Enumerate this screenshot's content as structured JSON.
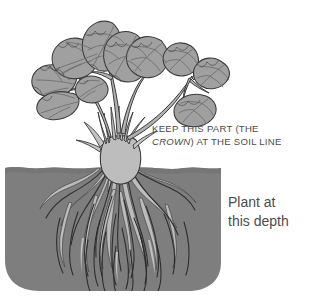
{
  "illustration": {
    "title": "Planting depth diagram for a crown-forming perennial",
    "subject": "strawberry-plant-planting-depth",
    "width": 311,
    "height": 307,
    "background_color": "#ffffff"
  },
  "annotations": {
    "crown": {
      "name": "crown-annotation",
      "line1": "KEEP THIS PART (THE",
      "line2_italic": "CROWN",
      "line2_rest": ") AT THE SOIL LINE",
      "text_color": "#4c4c4c"
    },
    "depth": {
      "name": "depth-annotation",
      "line1": "Plant at",
      "line2": "this depth",
      "text_color": "#4c4c4c"
    }
  },
  "colors": {
    "soil_fill": "#7e7e7e",
    "soil_edge": "#6f6f6f",
    "leaf_fill": "#a0a0a0",
    "leaf_outline": "#3a3a3a",
    "leaf_vein": "#6a6a6a",
    "stem_fill": "#b0b0b0",
    "stem_outline": "#3a3a3a",
    "crown_fill": "#bdbdbd",
    "crown_outline": "#3a3a3a",
    "root_fill": "#bcbcbc",
    "root_outline": "#555555",
    "fibrous_root": "#2e2e2e",
    "page_background": "#ffffff"
  },
  "parts": {
    "foliage": "leaf-canopy",
    "stems": "leaf-stems",
    "crown": "crown-at-soil-line",
    "soil": "soil-block",
    "soil_line": "soil-surface-line",
    "roots": "root-system"
  }
}
